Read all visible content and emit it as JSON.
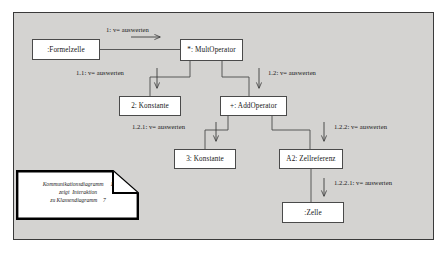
{
  "diagram": {
    "background_color": "#d4d3d1",
    "box_fill_color": "#ffffff",
    "line_color": "#4a4a4a",
    "objects": [
      {
        "id": "formelzelle",
        "label": ":Formelzelle"
      },
      {
        "id": "multoperator",
        "label": "*: MultOperator"
      },
      {
        "id": "konstante2",
        "label": "2: Konstante"
      },
      {
        "id": "addoperator",
        "label": "+: AddOperator"
      },
      {
        "id": "konstante3",
        "label": "3: Konstante"
      },
      {
        "id": "zellreferenz",
        "label": "A2: Zellreferenz"
      },
      {
        "id": "zelle",
        "label": ":Zelle"
      }
    ],
    "messages": [
      {
        "id": "m1",
        "label": "1: v= auswerten",
        "from": "formelzelle",
        "to": "multoperator"
      },
      {
        "id": "m11",
        "label": "1.1: v= auswerten",
        "from": "multoperator",
        "to": "konstante2"
      },
      {
        "id": "m12",
        "label": "1.2: v= auswerten",
        "from": "multoperator",
        "to": "addoperator"
      },
      {
        "id": "m121",
        "label": "1.2.1: v=  auswerten",
        "from": "addoperator",
        "to": "konstante3"
      },
      {
        "id": "m122",
        "label": "1.2.2: v=  auswerten",
        "from": "addoperator",
        "to": "zellreferenz"
      },
      {
        "id": "m1221",
        "label": "1.2.2.1: v=  auswerten",
        "from": "zellreferenz",
        "to": "zelle"
      }
    ],
    "note": {
      "line1": "Kommunikationsdiagramm     1",
      "line2": "zeigt  Interaktion",
      "line3": "zu Klassendiagramm    7"
    }
  }
}
